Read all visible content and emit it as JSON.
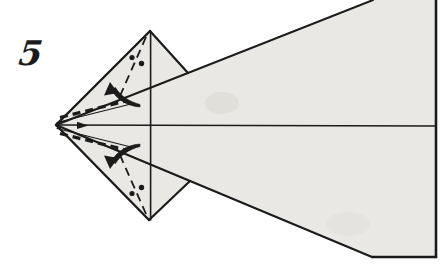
{
  "figure": {
    "step_label": "5",
    "kind": "origami-instruction-step",
    "icons": {
      "fold_arrow_top": "curved-fold-arrow-pointing-down-left",
      "fold_arrow_bottom": "curved-fold-arrow-pointing-up-left",
      "center_marker": "small-right-arrowhead",
      "reference_marks": "paired-dots-beside-dashed-fold-line"
    }
  },
  "colors": {
    "background": "#ffffff",
    "paper": "#e9e8e4",
    "line": "#1b1b1b"
  }
}
